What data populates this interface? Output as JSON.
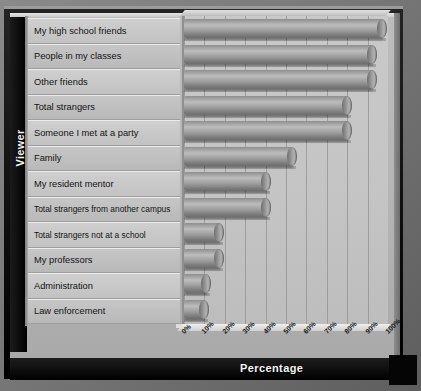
{
  "axes": {
    "y_title": "Viewer",
    "x_title": "Percentage"
  },
  "chart_data": {
    "type": "bar",
    "orientation": "horizontal",
    "title": "",
    "xlabel": "Percentage",
    "ylabel": "Viewer",
    "xlim": [
      0,
      100
    ],
    "grid": true,
    "legend": false,
    "tick_labels": [
      "0%",
      "10%",
      "20%",
      "30%",
      "40%",
      "50%",
      "60%",
      "70%",
      "80%",
      "90%",
      "100%"
    ],
    "tick_values": [
      0,
      10,
      20,
      30,
      40,
      50,
      60,
      70,
      80,
      90,
      100
    ],
    "categories": [
      "My high school friends",
      "People in my classes",
      "Other friends",
      "Total strangers",
      "Someone I met at a party",
      "Family",
      "My resident mentor",
      "Total strangers from another campus",
      "Total strangers not at a school",
      "My professors",
      "Administration",
      "Law enforcement"
    ],
    "values": [
      97,
      92,
      92,
      80,
      80,
      53,
      40,
      40,
      17,
      17,
      11,
      10
    ],
    "units": "percent"
  },
  "colors": {
    "frame": "#000000",
    "plate": "#b8b8b8",
    "bar": "#909090",
    "plot_background": "#c6c6c6",
    "gridline": "#a5a5a5",
    "label_text": "#141414",
    "axis_title_text": "#f2f2f2"
  }
}
